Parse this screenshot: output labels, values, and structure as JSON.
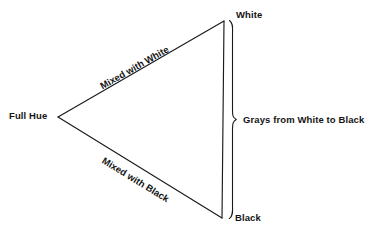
{
  "diagram": {
    "type": "color-theory-triangle",
    "background_color": "#ffffff",
    "line_color": "#1a1a1a",
    "text_color": "#141414",
    "vertices": {
      "full_hue": {
        "label": "Full Hue",
        "x": 58,
        "y": 117
      },
      "white": {
        "label": "White",
        "x": 224,
        "y": 21
      },
      "black": {
        "label": "Black",
        "x": 222,
        "y": 218
      }
    },
    "edges": {
      "upper": {
        "label": "Mixed with White",
        "from": "full_hue",
        "to": "white"
      },
      "lower": {
        "label": "Mixed with Black",
        "from": "full_hue",
        "to": "black"
      },
      "right": {
        "label": "",
        "from": "white",
        "to": "black"
      }
    },
    "brace": {
      "label": "Grays from White to Black",
      "spans_from": "White",
      "spans_to": "Black"
    }
  }
}
